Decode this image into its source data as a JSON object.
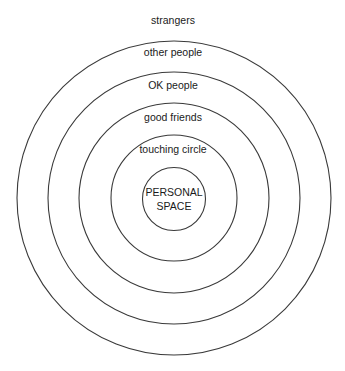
{
  "diagram": {
    "type": "concentric-circles",
    "center": {
      "x": 174,
      "y": 198
    },
    "stroke_color": "#3a3a3a",
    "rings": [
      {
        "label": "PERSONAL",
        "label2": "SPACE",
        "radius": 31
      },
      {
        "label": "touching circle",
        "radius": 63
      },
      {
        "label": "good friends",
        "radius": 94
      },
      {
        "label": "OK people",
        "radius": 125
      },
      {
        "label": "other people",
        "radius": 157
      }
    ],
    "outside_label": "strangers"
  }
}
